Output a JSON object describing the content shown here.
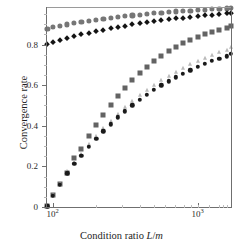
{
  "chart_data": {
    "type": "scatter",
    "title": "",
    "xlabel": "Condition ratio L/m",
    "xlabel_plain": "Condition ratio L/m",
    "ylabel": "Convergence rate",
    "xscale": "log",
    "xlim": [
      90,
      1700
    ],
    "ylim": [
      0,
      0.985
    ],
    "grid": false,
    "legend": "none",
    "xtick_labels": [
      "10²",
      "10³"
    ],
    "xticks": [
      100,
      1000
    ],
    "ytick_labels": [
      "0",
      "0.2",
      "0.4",
      "0.6",
      "0.8"
    ],
    "yticks": [
      0,
      0.2,
      0.4,
      0.6,
      0.8
    ],
    "x": [
      92,
      100,
      112,
      126,
      141,
      158,
      178,
      200,
      224,
      251,
      282,
      316,
      355,
      398,
      447,
      501,
      562,
      631,
      708,
      794,
      891,
      1000,
      1122,
      1259,
      1413,
      1585,
      1690
    ],
    "series": [
      {
        "name": "gray-circles",
        "marker": "circle",
        "color": "#767676",
        "size": 5.2,
        "values": [
          0.879,
          0.886,
          0.893,
          0.899,
          0.905,
          0.911,
          0.917,
          0.922,
          0.927,
          0.931,
          0.936,
          0.94,
          0.944,
          0.947,
          0.951,
          0.954,
          0.957,
          0.96,
          0.963,
          0.965,
          0.967,
          0.97,
          0.972,
          0.974,
          0.976,
          0.978,
          0.979
        ]
      },
      {
        "name": "black-diamonds",
        "marker": "diamond",
        "color": "#141414",
        "size": 3.8,
        "values": [
          0.804,
          0.814,
          0.824,
          0.833,
          0.842,
          0.85,
          0.858,
          0.866,
          0.873,
          0.88,
          0.887,
          0.893,
          0.899,
          0.905,
          0.91,
          0.915,
          0.92,
          0.925,
          0.929,
          0.933,
          0.937,
          0.941,
          0.944,
          0.948,
          0.951,
          0.954,
          0.955
        ]
      },
      {
        "name": "dark-gray-squares",
        "marker": "square",
        "color": "#636363",
        "size": 5.0,
        "values": [
          0.004,
          0.06,
          0.115,
          0.168,
          0.243,
          0.288,
          0.352,
          0.404,
          0.452,
          0.5,
          0.545,
          0.586,
          0.624,
          0.658,
          0.69,
          0.718,
          0.744,
          0.767,
          0.788,
          0.806,
          0.823,
          0.838,
          0.851,
          0.863,
          0.873,
          0.883,
          0.889
        ]
      },
      {
        "name": "light-gray-triangles",
        "marker": "triangle",
        "color": "#b9b9b9",
        "size": 4.6,
        "values": [
          0.004,
          0.058,
          0.112,
          0.176,
          0.222,
          0.262,
          0.308,
          0.349,
          0.388,
          0.425,
          0.46,
          0.492,
          0.523,
          0.551,
          0.578,
          0.602,
          0.625,
          0.647,
          0.667,
          0.686,
          0.704,
          0.72,
          0.735,
          0.749,
          0.762,
          0.775,
          0.788
        ]
      },
      {
        "name": "black-circles",
        "marker": "circle",
        "color": "#1a1a1a",
        "size": 4.4,
        "values": [
          0.004,
          0.056,
          0.108,
          0.166,
          0.212,
          0.252,
          0.296,
          0.336,
          0.373,
          0.408,
          0.441,
          0.472,
          0.501,
          0.528,
          0.553,
          0.577,
          0.599,
          0.62,
          0.639,
          0.657,
          0.674,
          0.69,
          0.705,
          0.719,
          0.731,
          0.743,
          0.755
        ]
      }
    ]
  },
  "axes": {
    "xlabel_prefix": "Condition ratio ",
    "xlabel_num": "L",
    "xlabel_slash": "/",
    "xlabel_den": "m",
    "ylabel_text": "Convergence rate"
  }
}
